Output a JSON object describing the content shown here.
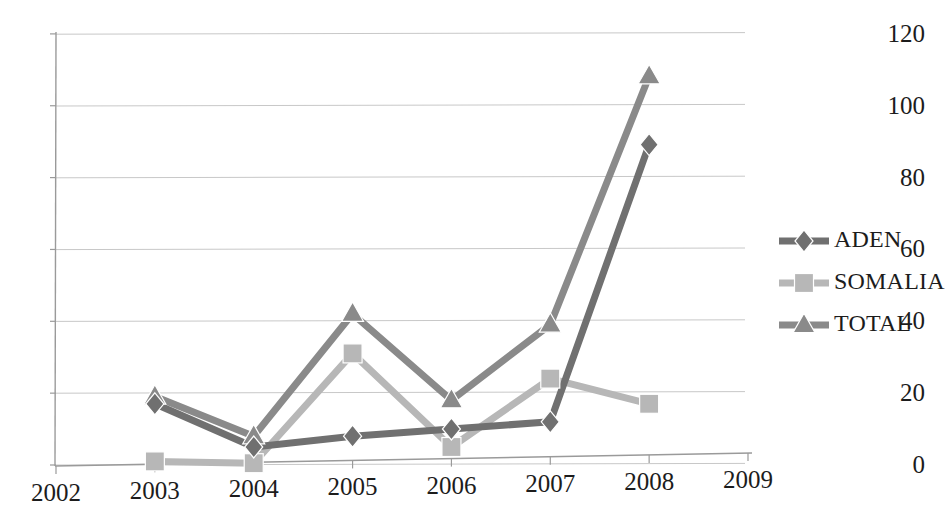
{
  "chart_data": {
    "type": "line",
    "title": "",
    "xlabel": "",
    "ylabel": "",
    "x": [
      2003,
      2004,
      2005,
      2006,
      2007,
      2008
    ],
    "x_tick_labels": [
      "2002",
      "2003",
      "2004",
      "2005",
      "2006",
      "2007",
      "2008",
      "2009"
    ],
    "xlim": [
      2002,
      2009
    ],
    "ylim": [
      0,
      120
    ],
    "y_tick_labels": [
      "0",
      "20",
      "40",
      "60",
      "80",
      "100",
      "120"
    ],
    "y_ticks": [
      0,
      20,
      40,
      60,
      80,
      100,
      120
    ],
    "grid": "horizontal",
    "legend_position": "right",
    "series": [
      {
        "name": "ADEN",
        "marker": "diamond",
        "color": "#707070",
        "values": [
          17,
          5,
          8,
          10,
          12,
          89
        ]
      },
      {
        "name": "SOMALIA",
        "marker": "square",
        "color": "#b7b7b7",
        "values": [
          1,
          0.5,
          31,
          5,
          24,
          17
        ]
      },
      {
        "name": "TOTAL",
        "marker": "triangle",
        "color": "#8a8a8a",
        "values": [
          19,
          8,
          42,
          18,
          39,
          108
        ]
      }
    ]
  },
  "legend": {
    "items": [
      {
        "label": "ADEN",
        "color": "#707070",
        "marker": "diamond"
      },
      {
        "label": "SOMALIA",
        "color": "#b7b7b7",
        "marker": "square"
      },
      {
        "label": "TOTAL",
        "color": "#8a8a8a",
        "marker": "triangle"
      }
    ]
  },
  "axes": {
    "axis_color": "#9a9a9a",
    "grid_color": "#c8c8c8",
    "tick_text_color": "#1c1c1c"
  }
}
